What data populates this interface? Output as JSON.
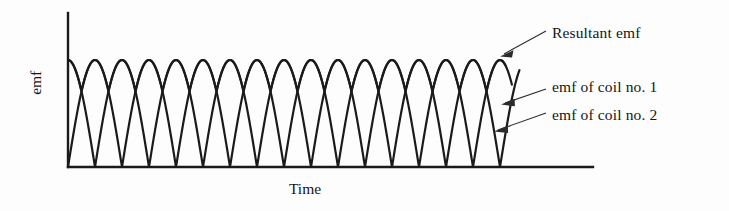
{
  "figure": {
    "background_color": "#fdfdfd",
    "stroke_color": "#1a1a1a",
    "axes": {
      "y_axis_label": "emf",
      "x_axis_label": "Time",
      "origin_x": 68,
      "baseline_y": 167,
      "top_y": 13,
      "right_x": 593
    },
    "callouts": [
      {
        "id": "resultant",
        "label": "Resultant emf"
      },
      {
        "id": "coil1",
        "label": "emf of coil no. 1"
      },
      {
        "id": "coil2",
        "label": "emf of coil no. 2"
      }
    ]
  },
  "chart_data": {
    "type": "line",
    "title": "",
    "xlabel": "Time",
    "ylabel": "emf",
    "grid": false,
    "legend_position": "right-callouts",
    "x_axis_ticks": [],
    "y_axis_ticks": [],
    "xlim": [
      0,
      8
    ],
    "ylim": [
      0,
      1
    ],
    "waveform": {
      "shape": "rectified-sine",
      "period_units": 1,
      "peak_amplitude": 1.0,
      "cycles_shown": 8,
      "coil1_phase_offset": 0.5,
      "coil2_phase_offset": 0.0
    },
    "series": [
      {
        "name": "emf of coil no. 1",
        "phase_offset": 0.5,
        "peak": 1.0,
        "start_value": 1.0,
        "samples_x": [
          0.0,
          0.25,
          0.5,
          0.75,
          1.0,
          1.25,
          1.5,
          1.75,
          2.0,
          2.25,
          2.5,
          2.75,
          3.0,
          3.25,
          3.5,
          3.75,
          4.0,
          4.25,
          4.5,
          4.75,
          5.0,
          5.25,
          5.5,
          5.75,
          6.0,
          6.25,
          6.5,
          6.75,
          7.0,
          7.25,
          7.5,
          7.75,
          8.0
        ],
        "samples_y": [
          1.0,
          0.707,
          0.0,
          0.707,
          1.0,
          0.707,
          0.0,
          0.707,
          1.0,
          0.707,
          0.0,
          0.707,
          1.0,
          0.707,
          0.0,
          0.707,
          1.0,
          0.707,
          0.0,
          0.707,
          1.0,
          0.707,
          0.0,
          0.707,
          1.0,
          0.707,
          0.0,
          0.707,
          1.0,
          0.707,
          0.0,
          0.707,
          1.0
        ]
      },
      {
        "name": "emf of coil no. 2",
        "phase_offset": 0.0,
        "peak": 1.0,
        "start_value": 0.0,
        "samples_x": [
          0.0,
          0.25,
          0.5,
          0.75,
          1.0,
          1.25,
          1.5,
          1.75,
          2.0,
          2.25,
          2.5,
          2.75,
          3.0,
          3.25,
          3.5,
          3.75,
          4.0,
          4.25,
          4.5,
          4.75,
          5.0,
          5.25,
          5.5,
          5.75,
          6.0,
          6.25,
          6.5,
          6.75,
          7.0,
          7.25,
          7.5,
          7.75,
          8.0
        ],
        "samples_y": [
          0.0,
          0.707,
          1.0,
          0.707,
          0.0,
          0.707,
          1.0,
          0.707,
          0.0,
          0.707,
          1.0,
          0.707,
          0.0,
          0.707,
          1.0,
          0.707,
          0.0,
          0.707,
          1.0,
          0.707,
          0.0,
          0.707,
          1.0,
          0.707,
          0.0,
          0.707,
          1.0,
          0.707,
          0.0,
          0.707,
          1.0,
          0.707,
          0.0
        ]
      },
      {
        "name": "Resultant emf",
        "type": "envelope-max",
        "peak": 1.0,
        "trough": 0.707,
        "arches": 8,
        "samples_x": [
          0.0,
          0.25,
          0.5,
          0.75,
          1.0,
          1.25,
          1.5,
          1.75,
          2.0,
          2.25,
          2.5,
          2.75,
          3.0,
          3.25,
          3.5,
          3.75,
          4.0,
          4.25,
          4.5,
          4.75,
          5.0,
          5.25,
          5.5,
          5.75,
          6.0,
          6.25,
          6.5,
          6.75,
          7.0,
          7.25,
          7.5,
          7.75,
          8.0
        ],
        "samples_y": [
          1.0,
          0.707,
          1.0,
          0.707,
          1.0,
          0.707,
          1.0,
          0.707,
          1.0,
          0.707,
          1.0,
          0.707,
          1.0,
          0.707,
          1.0,
          0.707,
          1.0,
          0.707,
          1.0,
          0.707,
          1.0,
          0.707,
          1.0,
          0.707,
          1.0,
          0.707,
          1.0,
          0.707,
          1.0,
          0.707,
          1.0,
          0.707,
          1.0
        ]
      }
    ]
  }
}
